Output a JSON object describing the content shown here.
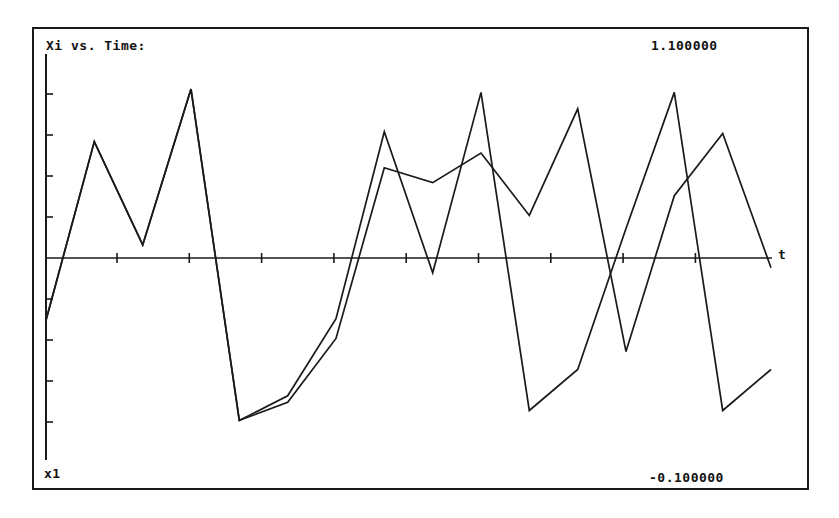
{
  "chart_data": {
    "type": "line",
    "title": "Xi vs. Time:",
    "xlabel": "t",
    "ylabel": "x1",
    "y_range_labels": {
      "max": "1.100000",
      "min": "-0.100000"
    },
    "grid": false,
    "legend": null,
    "x_ticks": 9,
    "y_ticks_above": 4,
    "y_ticks_below": 4,
    "x": [
      0,
      1,
      2,
      3,
      4,
      5,
      6,
      7,
      8,
      9,
      10,
      11,
      12,
      13,
      14,
      15
    ],
    "series": [
      {
        "name": "series-a",
        "values": [
          -0.38,
          0.71,
          0.08,
          1.03,
          -0.99,
          -0.84,
          -0.37,
          0.77,
          -0.09,
          1.01,
          -0.93,
          -0.68,
          0.18,
          1.01,
          -0.93,
          -0.68
        ]
      },
      {
        "name": "series-b",
        "values": [
          -0.38,
          0.71,
          0.08,
          1.03,
          -0.99,
          -0.88,
          -0.49,
          0.55,
          0.46,
          0.64,
          0.26,
          0.91,
          -0.57,
          0.38,
          0.76,
          -0.06
        ]
      }
    ]
  },
  "colors": {
    "line": "#1a1a1a",
    "background": "#ffffff"
  }
}
